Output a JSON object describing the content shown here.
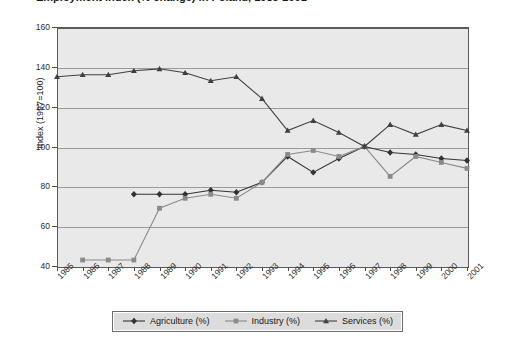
{
  "title": {
    "text": "Employment index (% change) in Poland, 1985-2001",
    "clipped": true
  },
  "chart_data": {
    "type": "line",
    "title": "Employment index (% change) in Poland, 1985-2001",
    "xlabel": "",
    "ylabel": "Index (1997=100)",
    "x": [
      1985,
      1986,
      1987,
      1988,
      1989,
      1990,
      1991,
      1992,
      1993,
      1994,
      1995,
      1996,
      1997,
      1998,
      1999,
      2000,
      2001
    ],
    "xticklabels": [
      "1985",
      "1986",
      "1987",
      "1988",
      "1989",
      "1990",
      "1991",
      "1992",
      "1993",
      "1994",
      "1995",
      "1996",
      "1997",
      "1998",
      "1999",
      "2000",
      "2001"
    ],
    "xlim": [
      1985,
      2001
    ],
    "ylim": [
      40,
      160
    ],
    "yticks": [
      40,
      60,
      80,
      100,
      120,
      140,
      160
    ],
    "yticklabels": [
      "40",
      "60",
      "80",
      "100",
      "120",
      "140",
      "160"
    ],
    "grid": true,
    "grid_axis": "y",
    "legend_position": "bottom",
    "plot_background": "#e9e9e9",
    "series": [
      {
        "name": "Agriculture (%)",
        "marker": "diamond",
        "color": "#333333",
        "x": [
          1988,
          1989,
          1990,
          1991,
          1992,
          1993,
          1994,
          1995,
          1996,
          1997,
          1998,
          1999,
          2000,
          2001
        ],
        "values": [
          76,
          76,
          76,
          78,
          77,
          82,
          95,
          87,
          94,
          100,
          97,
          96,
          94,
          93
        ]
      },
      {
        "name": "Industry (%)",
        "marker": "square",
        "color": "#8a8a8a",
        "x": [
          1986,
          1987,
          1988,
          1989,
          1990,
          1991,
          1992,
          1993,
          1994,
          1995,
          1996,
          1997,
          1998,
          1999,
          2000,
          2001
        ],
        "values": [
          43,
          43,
          43,
          69,
          74,
          76,
          74,
          82,
          96,
          98,
          95,
          100,
          85,
          95,
          92,
          89
        ]
      },
      {
        "name": "Services (%)",
        "marker": "triangle",
        "color": "#404040",
        "x": [
          1985,
          1986,
          1987,
          1988,
          1989,
          1990,
          1991,
          1992,
          1993,
          1994,
          1995,
          1996,
          1997,
          1998,
          1999,
          2000,
          2001
        ],
        "values": [
          135,
          136,
          136,
          138,
          139,
          137,
          133,
          135,
          124,
          108,
          113,
          107,
          100,
          111,
          106,
          111,
          108
        ]
      }
    ]
  },
  "legend": {
    "items": [
      {
        "label": "Agriculture (%)",
        "marker": "diamond",
        "color": "#333333"
      },
      {
        "label": "Industry (%)",
        "marker": "square",
        "color": "#8a8a8a"
      },
      {
        "label": "Services (%)",
        "marker": "triangle",
        "color": "#404040"
      }
    ]
  }
}
